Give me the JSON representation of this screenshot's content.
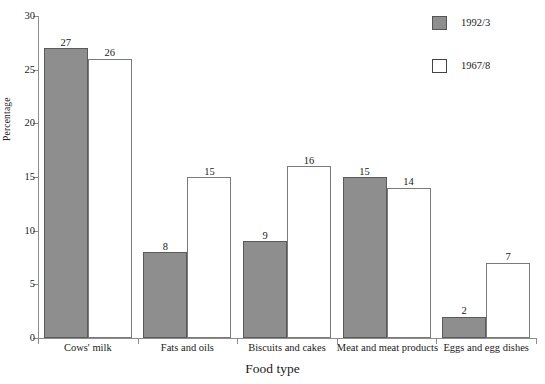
{
  "chart_data": {
    "type": "bar",
    "title": "",
    "xlabel": "Food type",
    "ylabel": "Percentage",
    "ylim": [
      0,
      30
    ],
    "yticks": [
      0,
      5,
      10,
      15,
      20,
      25,
      30
    ],
    "grid": false,
    "legend_position": "top-right",
    "categories": [
      "Cows' milk",
      "Fats and oils",
      "Biscuits and cakes",
      "Meat and meat products",
      "Eggs and egg dishes"
    ],
    "series": [
      {
        "name": "1992/3",
        "style": "filled",
        "color": "#8e8e8e",
        "values": [
          27,
          8,
          9,
          15,
          2
        ]
      },
      {
        "name": "1967/8",
        "style": "hollow",
        "color": "#ffffff",
        "values": [
          26,
          15,
          16,
          14,
          7
        ]
      }
    ]
  },
  "axes": {
    "y_label": "Percentage",
    "x_label": "Food type",
    "y_ticks": [
      "0",
      "5",
      "10",
      "15",
      "20",
      "25",
      "30"
    ]
  },
  "legend": {
    "items": [
      {
        "label": "1992/3",
        "swatch": "filled-gray-square"
      },
      {
        "label": "1967/8",
        "swatch": "hollow-white-square"
      }
    ]
  }
}
